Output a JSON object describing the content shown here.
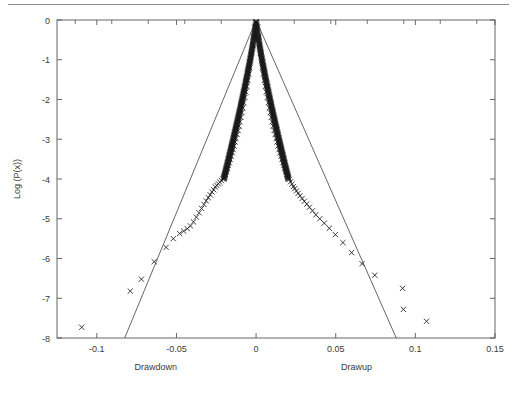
{
  "figure": {
    "divider_color": "#8c8c8c",
    "axis_color": "#555555",
    "fit_line_color": "#555555",
    "marker_color": "#1a1a1a",
    "background": "#ffffff"
  },
  "chart_data": {
    "type": "scatter",
    "title": "",
    "subtitle": "",
    "xlabel_left": "Drawdown",
    "xlabel_right": "Drawup",
    "ylabel": "Log (P(x))",
    "xlim": [
      -0.125,
      0.15
    ],
    "ylim": [
      -8,
      0
    ],
    "xticks": [
      -0.1,
      -0.05,
      0,
      0.05,
      0.1,
      0.15
    ],
    "xticklabels": [
      "-0.1",
      "-0.05",
      "0",
      "0.05",
      "0.1",
      "0.15"
    ],
    "yticks": [
      0,
      -1,
      -2,
      -3,
      -4,
      -5,
      -6,
      -7,
      -8
    ],
    "yticklabels": [
      "0",
      "-1",
      "-2",
      "-3",
      "-4",
      "-5",
      "-6",
      "-7",
      "-8"
    ],
    "grid": false,
    "legend": null,
    "marker": "x",
    "series": [
      {
        "name": "Drawdown distribution",
        "side": "left",
        "points": [
          [
            -0.001,
            -0.18
          ],
          [
            -0.0016,
            -0.42
          ],
          [
            -0.0022,
            -0.63
          ],
          [
            -0.0028,
            -0.84
          ],
          [
            -0.0034,
            -1.02
          ],
          [
            -0.004,
            -1.2
          ],
          [
            -0.0046,
            -1.36
          ],
          [
            -0.0052,
            -1.52
          ],
          [
            -0.0058,
            -1.67
          ],
          [
            -0.0064,
            -1.81
          ],
          [
            -0.007,
            -1.95
          ],
          [
            -0.0077,
            -2.08
          ],
          [
            -0.0083,
            -2.21
          ],
          [
            -0.0089,
            -2.33
          ],
          [
            -0.0095,
            -2.45
          ],
          [
            -0.0101,
            -2.56
          ],
          [
            -0.0107,
            -2.67
          ],
          [
            -0.0113,
            -2.78
          ],
          [
            -0.012,
            -2.88
          ],
          [
            -0.0126,
            -2.98
          ],
          [
            -0.0132,
            -3.07
          ],
          [
            -0.0138,
            -3.17
          ],
          [
            -0.0144,
            -3.26
          ],
          [
            -0.015,
            -3.34
          ],
          [
            -0.0157,
            -3.43
          ],
          [
            -0.0163,
            -3.51
          ],
          [
            -0.0169,
            -3.59
          ],
          [
            -0.0175,
            -3.66
          ],
          [
            -0.0181,
            -3.74
          ],
          [
            -0.0188,
            -3.81
          ],
          [
            -0.0194,
            -3.88
          ],
          [
            -0.02,
            -3.94
          ],
          [
            -0.0209,
            -4.0
          ],
          [
            -0.0218,
            -4.04
          ],
          [
            -0.0228,
            -4.08
          ],
          [
            -0.0237,
            -4.12
          ],
          [
            -0.0247,
            -4.16
          ],
          [
            -0.0256,
            -4.2
          ],
          [
            -0.0266,
            -4.27
          ],
          [
            -0.0277,
            -4.33
          ],
          [
            -0.0288,
            -4.4
          ],
          [
            -0.03,
            -4.47
          ],
          [
            -0.0313,
            -4.55
          ],
          [
            -0.0327,
            -4.64
          ],
          [
            -0.0342,
            -4.74
          ],
          [
            -0.0358,
            -4.85
          ],
          [
            -0.0375,
            -4.96
          ],
          [
            -0.0393,
            -5.08
          ],
          [
            -0.0412,
            -5.18
          ],
          [
            -0.0432,
            -5.25
          ],
          [
            -0.0455,
            -5.31
          ],
          [
            -0.048,
            -5.37
          ],
          [
            -0.052,
            -5.5
          ],
          [
            -0.0565,
            -5.72
          ],
          [
            -0.064,
            -6.08
          ],
          [
            -0.072,
            -6.52
          ],
          [
            -0.079,
            -6.82
          ],
          [
            -0.1095,
            -7.73
          ]
        ]
      },
      {
        "name": "Drawup distribution",
        "side": "right",
        "points": [
          [
            0.001,
            -0.18
          ],
          [
            0.0016,
            -0.42
          ],
          [
            0.0022,
            -0.63
          ],
          [
            0.0028,
            -0.84
          ],
          [
            0.0034,
            -1.02
          ],
          [
            0.004,
            -1.2
          ],
          [
            0.0046,
            -1.36
          ],
          [
            0.0052,
            -1.52
          ],
          [
            0.0058,
            -1.67
          ],
          [
            0.0064,
            -1.81
          ],
          [
            0.007,
            -1.95
          ],
          [
            0.0077,
            -2.08
          ],
          [
            0.0083,
            -2.21
          ],
          [
            0.0089,
            -2.33
          ],
          [
            0.0095,
            -2.45
          ],
          [
            0.0101,
            -2.56
          ],
          [
            0.0107,
            -2.67
          ],
          [
            0.0113,
            -2.78
          ],
          [
            0.012,
            -2.88
          ],
          [
            0.0126,
            -2.98
          ],
          [
            0.0132,
            -3.07
          ],
          [
            0.0138,
            -3.17
          ],
          [
            0.0144,
            -3.26
          ],
          [
            0.015,
            -3.34
          ],
          [
            0.0157,
            -3.43
          ],
          [
            0.0163,
            -3.51
          ],
          [
            0.0169,
            -3.59
          ],
          [
            0.0175,
            -3.66
          ],
          [
            0.0181,
            -3.74
          ],
          [
            0.0188,
            -3.81
          ],
          [
            0.0194,
            -3.88
          ],
          [
            0.02,
            -3.94
          ],
          [
            0.0208,
            -4.01
          ],
          [
            0.0216,
            -4.07
          ],
          [
            0.0225,
            -4.13
          ],
          [
            0.0234,
            -4.19
          ],
          [
            0.0243,
            -4.24
          ],
          [
            0.0253,
            -4.3
          ],
          [
            0.0264,
            -4.36
          ],
          [
            0.0276,
            -4.42
          ],
          [
            0.0289,
            -4.49
          ],
          [
            0.0303,
            -4.56
          ],
          [
            0.0318,
            -4.63
          ],
          [
            0.0335,
            -4.71
          ],
          [
            0.0354,
            -4.8
          ],
          [
            0.0375,
            -4.9
          ],
          [
            0.04,
            -5.0
          ],
          [
            0.0428,
            -5.11
          ],
          [
            0.046,
            -5.24
          ],
          [
            0.0498,
            -5.4
          ],
          [
            0.0545,
            -5.6
          ],
          [
            0.06,
            -5.85
          ],
          [
            0.0665,
            -6.13
          ],
          [
            0.0745,
            -6.42
          ],
          [
            0.092,
            -6.75
          ],
          [
            0.0925,
            -7.28
          ],
          [
            0.107,
            -7.58
          ]
        ]
      }
    ],
    "fits": [
      {
        "name": "Exponential fit (drawdown)",
        "side": "left",
        "x": [
          0.0,
          -0.0825
        ],
        "y": [
          0.0,
          -8.0
        ],
        "style": "solid"
      },
      {
        "name": "Exponential fit (drawup)",
        "side": "right",
        "x": [
          0.0,
          0.088
        ],
        "y": [
          0.0,
          -8.0
        ],
        "style": "solid"
      }
    ],
    "annotations": []
  }
}
